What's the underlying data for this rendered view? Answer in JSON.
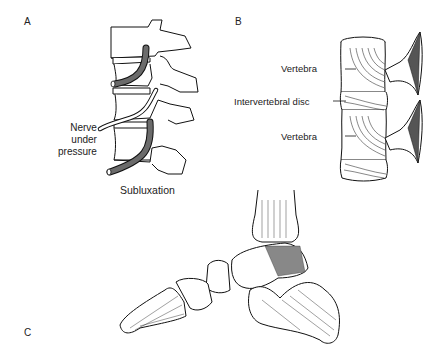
{
  "panels": {
    "a": {
      "letter": "A",
      "title": "Subluxation",
      "nerve_label": [
        "Nerve",
        "under",
        "pressure"
      ]
    },
    "b": {
      "letter": "B",
      "labels": [
        "Vertebra",
        "Intervertebral disc",
        "Vertebra"
      ]
    },
    "c": {
      "letter": "C"
    }
  },
  "colors": {
    "line": "#111111",
    "nerve_fill": "#6b6b6b",
    "background": "#ffffff"
  }
}
